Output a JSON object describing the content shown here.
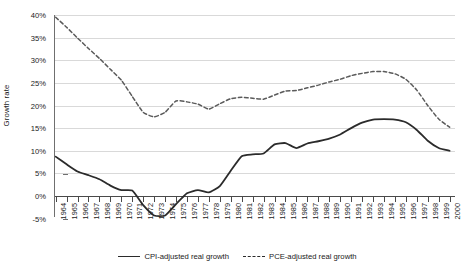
{
  "chart_data": {
    "type": "line",
    "title": "",
    "xlabel": "",
    "ylabel": "Growth rate",
    "ylim": [
      -5,
      40
    ],
    "ytick_labels": [
      "40%",
      "35%",
      "30%",
      "25%",
      "20%",
      "15%",
      "10%",
      "5%",
      "0%",
      "-5%"
    ],
    "ytick_values": [
      40,
      35,
      30,
      25,
      20,
      15,
      10,
      5,
      0,
      -5
    ],
    "grid": true,
    "grid_axis": "y",
    "legend_position": "bottom",
    "categories": [
      "1964",
      "1965",
      "1966",
      "1967",
      "1968",
      "1969",
      "1970",
      "1971",
      "1972",
      "1973",
      "1974",
      "1975",
      "1976",
      "1977",
      "1978",
      "1979",
      "1980",
      "1981",
      "1982",
      "1983",
      "1984",
      "1985",
      "1986",
      "1987",
      "1988",
      "1989",
      "1990",
      "1991",
      "1992",
      "1993",
      "1994",
      "1995",
      "1996",
      "1997",
      "1998",
      "1999",
      "2000"
    ],
    "series": [
      {
        "name": "CPI-adjusted real growth",
        "style": "solid",
        "color": "#2b2b2b",
        "values": [
          8.7,
          7.0,
          5.4,
          4.6,
          3.7,
          2.3,
          1.3,
          1.2,
          -2.0,
          -4.3,
          -4.3,
          -1.8,
          0.6,
          1.3,
          0.8,
          2.2,
          5.6,
          8.8,
          9.2,
          9.4,
          11.4,
          11.7,
          10.6,
          11.6,
          12.1,
          12.7,
          13.6,
          15.0,
          16.2,
          16.9,
          17.0,
          16.9,
          16.3,
          14.6,
          12.2,
          10.6,
          10.0
        ]
      },
      {
        "name": "PCE-adjusted real growth",
        "style": "dashed",
        "color": "#5a5a5a",
        "values": [
          39.5,
          37.3,
          34.9,
          32.6,
          30.4,
          28.0,
          25.6,
          22.0,
          18.5,
          17.5,
          18.5,
          21.0,
          20.8,
          20.3,
          19.2,
          20.4,
          21.5,
          21.8,
          21.6,
          21.4,
          22.3,
          23.2,
          23.3,
          23.9,
          24.5,
          25.2,
          25.8,
          26.6,
          27.1,
          27.5,
          27.5,
          27.0,
          25.8,
          23.4,
          20.0,
          17.0,
          15.2
        ]
      }
    ]
  },
  "legend": {
    "entries": [
      {
        "label": "CPI-adjusted real growth",
        "icon": "solid-line-icon"
      },
      {
        "label": "PCE-adjusted real growth",
        "icon": "dashed-line-icon"
      }
    ]
  }
}
